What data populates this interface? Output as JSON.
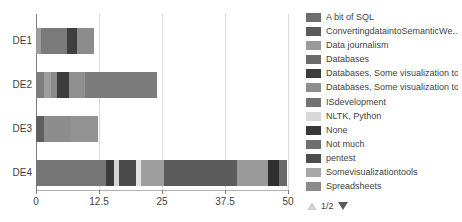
{
  "chart_data": {
    "type": "bar",
    "orientation": "horizontal",
    "stacked": true,
    "title": "",
    "xlabel": "",
    "ylabel": "",
    "categories": [
      "DE1",
      "DE2",
      "DE3",
      "DE4"
    ],
    "xlim": [
      0,
      50
    ],
    "xticks": [
      0,
      12.5,
      25,
      37.5,
      50
    ],
    "xtick_labels": [
      "0",
      "12.5",
      "25",
      "37.5",
      "50"
    ],
    "grid": true,
    "legend_position": "right",
    "series": [
      {
        "name": "A bit of SQL",
        "color": "#6e6e6e",
        "values": [
          0,
          0,
          0,
          6.0
        ]
      },
      {
        "name": "ConvertingdataintoSemanticWe...",
        "color": "#5a5a5a",
        "values": [
          0,
          0,
          0,
          0
        ]
      },
      {
        "name": "Data journalism",
        "color": "#9a9a9a",
        "values": [
          2.2,
          0,
          0,
          7.5
        ]
      },
      {
        "name": "Databases",
        "color": "#6b6b6b",
        "values": [
          0,
          1.6,
          0,
          0
        ]
      },
      {
        "name": "Databases, Some visualization tools",
        "color": "#3c3c3c",
        "values": [
          0,
          0,
          0,
          1.0
        ]
      },
      {
        "name": "Databases, Some visualization too...",
        "color": "#8e8e8e",
        "values": [
          0,
          2.0,
          0,
          0
        ]
      },
      {
        "name": "ISdevelopment",
        "color": "#737373",
        "values": [
          0,
          0,
          0,
          0
        ]
      },
      {
        "name": "NLTK, Python",
        "color": "#d8d8d8",
        "values": [
          0,
          0,
          0,
          1.1
        ]
      },
      {
        "name": "None",
        "color": "#383838",
        "values": [
          2.0,
          2.2,
          0,
          2.5
        ]
      },
      {
        "name": "Not much",
        "color": "#6f6f6f",
        "values": [
          0,
          0,
          4.0,
          0
        ]
      },
      {
        "name": "pentest",
        "color": "#4d4d4d",
        "values": [
          0,
          0,
          0,
          0
        ]
      },
      {
        "name": "Somevisualizationtools",
        "color": "#a8a8a8",
        "values": [
          3.0,
          0,
          0,
          0
        ]
      },
      {
        "name": "Spreadsheets",
        "color": "#8a8a8a",
        "values": [
          0,
          0,
          0,
          0
        ]
      }
    ],
    "bars": [
      {
        "category": "DE1",
        "total": 11.6,
        "segments": [
          {
            "label": "Somevisualizationtools",
            "value": 1.0,
            "color": "#9d9d9d"
          },
          {
            "label": "Data journalism",
            "value": 5.1,
            "color": "#7a7a7a"
          },
          {
            "label": "None",
            "value": 2.0,
            "color": "#3f3f3f"
          },
          {
            "label": "Databases",
            "value": 3.5,
            "color": "#8c8c8c"
          }
        ]
      },
      {
        "category": "DE2",
        "total": 24.0,
        "segments": [
          {
            "label": "A bit of SQL",
            "value": 1.6,
            "color": "#7d7d7d"
          },
          {
            "label": "Data journalism",
            "value": 1.4,
            "color": "#9d9d9d"
          },
          {
            "label": "Databases",
            "value": 1.2,
            "color": "#8a8a8a"
          },
          {
            "label": "None",
            "value": 2.3,
            "color": "#3d3d3d"
          },
          {
            "label": "Not much",
            "value": 3.3,
            "color": "#8f8f8f"
          },
          {
            "label": "Spreadsheets",
            "value": 14.2,
            "color": "#7b7b7b"
          }
        ]
      },
      {
        "category": "DE3",
        "total": 12.4,
        "segments": [
          {
            "label": "A bit of SQL",
            "value": 1.6,
            "color": "#5f5f5f"
          },
          {
            "label": "Not much",
            "value": 5.4,
            "color": "#8d8d8d"
          },
          {
            "label": "Somevisualizationtools",
            "value": 5.4,
            "color": "#939393"
          }
        ]
      },
      {
        "category": "DE4",
        "total": 49.8,
        "segments": [
          {
            "label": "Data journalism",
            "value": 13.8,
            "color": "#767676"
          },
          {
            "label": "None",
            "value": 1.6,
            "color": "#3c3c3c"
          },
          {
            "label": "NLTK, Python",
            "value": 1.1,
            "color": "#d5d5d5"
          },
          {
            "label": "Databases, Some visualization tools",
            "value": 3.4,
            "color": "#4a4a4a"
          },
          {
            "label": "Spreadsheets",
            "value": 1.0,
            "color": "#e2e2e2"
          },
          {
            "label": "Somevisualizationtools",
            "value": 4.6,
            "color": "#9e9e9e"
          },
          {
            "label": "A bit of SQL",
            "value": 14.4,
            "color": "#5b5b5b"
          },
          {
            "label": "Databases",
            "value": 6.2,
            "color": "#9a9a9a"
          },
          {
            "label": "pentest",
            "value": 2.2,
            "color": "#2f2f2f"
          },
          {
            "label": "ISdevelopment",
            "value": 1.5,
            "color": "#6a6a6a"
          }
        ]
      }
    ]
  },
  "legend": {
    "items": [
      {
        "label": "A bit of SQL",
        "color": "#6e6e6e"
      },
      {
        "label": "ConvertingdataintoSemanticWe...",
        "color": "#5a5a5a"
      },
      {
        "label": "Data journalism",
        "color": "#9a9a9a"
      },
      {
        "label": "Databases",
        "color": "#6b6b6b"
      },
      {
        "label": "Databases, Some visualization tools",
        "color": "#3c3c3c"
      },
      {
        "label": "Databases, Some visualization too...",
        "color": "#8e8e8e"
      },
      {
        "label": "ISdevelopment",
        "color": "#737373"
      },
      {
        "label": "NLTK, Python",
        "color": "#d8d8d8"
      },
      {
        "label": "None",
        "color": "#383838"
      },
      {
        "label": "Not much",
        "color": "#6f6f6f"
      },
      {
        "label": "pentest",
        "color": "#4d4d4d"
      },
      {
        "label": "Somevisualizationtools",
        "color": "#a8a8a8"
      },
      {
        "label": "Spreadsheets",
        "color": "#8a8a8a"
      }
    ],
    "pager": {
      "text": "1/2",
      "up_enabled": false,
      "down_enabled": true
    }
  },
  "colors": {
    "grid": "#d9d9d9",
    "axis": "#7f7f7f",
    "text": "#3f3f3f",
    "background": "#ffffff"
  }
}
